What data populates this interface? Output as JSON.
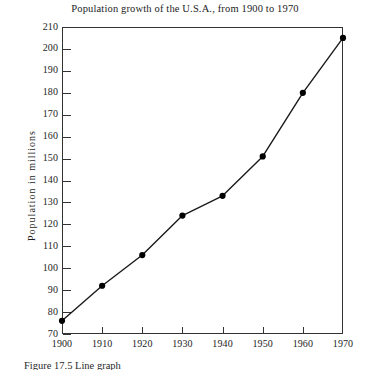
{
  "chart_data": {
    "type": "line",
    "title": "Population growth of the U.S.A., from 1900 to 1970",
    "xlabel": "",
    "ylabel": "Population  in  millions",
    "x": [
      1900,
      1910,
      1920,
      1930,
      1940,
      1950,
      1960,
      1970
    ],
    "values": [
      76,
      92,
      106,
      124,
      133,
      151,
      180,
      205
    ],
    "series": [
      {
        "name": "U.S.A. population",
        "values": [
          76,
          92,
          106,
          124,
          133,
          151,
          180,
          205
        ]
      }
    ],
    "xlim": [
      1900,
      1970
    ],
    "ylim": [
      70,
      210
    ],
    "xticks": [
      1900,
      1910,
      1920,
      1930,
      1940,
      1950,
      1960,
      1970
    ],
    "xtick_labels": [
      "1900",
      "1910",
      "1920",
      "1930",
      "1940",
      "1950",
      "1960",
      "1970"
    ],
    "yticks": [
      70,
      80,
      90,
      100,
      110,
      120,
      130,
      140,
      150,
      160,
      170,
      180,
      190,
      200,
      210
    ],
    "ytick_labels": [
      "70",
      "80",
      "90",
      "100",
      "110",
      "120",
      "130",
      "140",
      "150",
      "160",
      "170",
      "180",
      "190",
      "200",
      "210"
    ],
    "grid": false,
    "legend": false,
    "marker": "filled-circle",
    "line_color": "#1a1a1a",
    "marker_color": "#000000",
    "frame_color": "#333333",
    "background": "#ffffff"
  },
  "caption": {
    "text": "Figure 17.5   Line graph"
  }
}
